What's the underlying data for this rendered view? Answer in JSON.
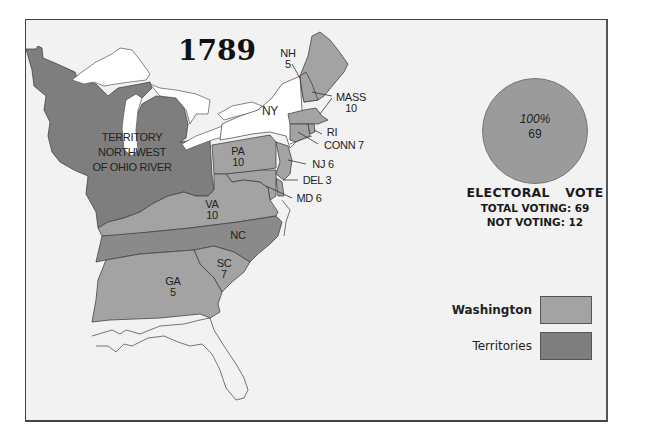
{
  "title": "1789",
  "colors": {
    "washington": "#a3a3a3",
    "territories": "#7e7e7e",
    "nonvoting_state": "#ffffff",
    "background": "#f2f2f2",
    "unlabeled_land": "#f2f2f2"
  },
  "map_labels": {
    "territory": [
      "TERRITORY",
      "NORTHWEST",
      "OF OHIO RIVER"
    ],
    "nh": {
      "state": "NH",
      "votes": "5"
    },
    "ny": {
      "state": "NY"
    },
    "mass": {
      "state": "MASS",
      "votes": "10"
    },
    "ri": {
      "state": "RI"
    },
    "conn": {
      "text": "CONN 7"
    },
    "pa": {
      "state": "PA",
      "votes": "10"
    },
    "nj": {
      "text": "NJ 6"
    },
    "del": {
      "text": "DEL 3"
    },
    "md": {
      "text": "MD 6"
    },
    "va": {
      "state": "VA",
      "votes": "10"
    },
    "nc": {
      "state": "NC"
    },
    "sc": {
      "state": "SC",
      "votes": "7"
    },
    "ga": {
      "state": "GA",
      "votes": "5"
    }
  },
  "pie": {
    "percent": "100%",
    "value": "69"
  },
  "electoral": {
    "title": "ELECTORAL  VOTE",
    "total_voting": "TOTAL VOTING: 69",
    "not_voting": "NOT VOTING: 12"
  },
  "legend": [
    {
      "label": "Washington",
      "color": "#a3a3a3"
    },
    {
      "label": "Territories",
      "color": "#7e7e7e"
    }
  ]
}
